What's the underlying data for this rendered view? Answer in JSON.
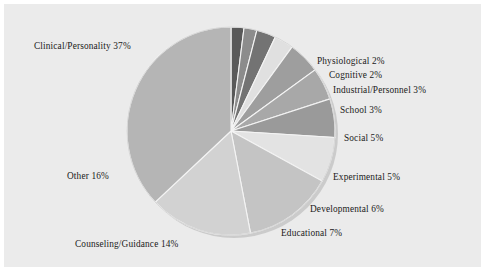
{
  "figure": {
    "background_color": "#ebebeb",
    "page_color": "#ffffff",
    "text_color": "#1a1a1a"
  },
  "chart_data": {
    "type": "pie",
    "title": "",
    "subtitle": "",
    "xlabel": "",
    "ylabel": "",
    "legend_position": "none",
    "grid": false,
    "labels_inline": true,
    "total_percent": 100,
    "units": "percent",
    "center": {
      "x": 231,
      "y": 131
    },
    "radius": 104,
    "start_angle_deg": 0,
    "direction": "clockwise",
    "slices": [
      {
        "label": "Physiological",
        "value": 2,
        "display": "Physiological 2%",
        "color": "#595959"
      },
      {
        "label": "Cognitive",
        "value": 2,
        "display": "Cognitive 2%",
        "color": "#8c8c8c"
      },
      {
        "label": "Industrial/Personnel",
        "value": 3,
        "display": "Industrial/Personnel 3%",
        "color": "#737373"
      },
      {
        "label": "School",
        "value": 3,
        "display": "School 3%",
        "color": "#e0e0e0"
      },
      {
        "label": "Social",
        "value": 5,
        "display": "Social 5%",
        "color": "#9e9e9e"
      },
      {
        "label": "Experimental",
        "value": 5,
        "display": "Experimental 5%",
        "color": "#a8a8a8"
      },
      {
        "label": "Developmental",
        "value": 6,
        "display": "Developmental 6%",
        "color": "#9a9a9a"
      },
      {
        "label": "Educational",
        "value": 7,
        "display": "Educational 7%",
        "color": "#e3e3e3"
      },
      {
        "label": "Counseling/Guidance",
        "value": 14,
        "display": "Counseling/Guidance 14%",
        "color": "#c4c4c4"
      },
      {
        "label": "Other",
        "value": 16,
        "display": "Other 16%",
        "color": "#d2d2d2"
      },
      {
        "label": "Clinical/Personality",
        "value": 37,
        "display": "Clinical/Personality 37%",
        "color": "#b5b5b5"
      }
    ],
    "categories": [
      "Physiological",
      "Cognitive",
      "Industrial/Personnel",
      "School",
      "Social",
      "Experimental",
      "Developmental",
      "Educational",
      "Counseling/Guidance",
      "Other",
      "Clinical/Personality"
    ],
    "values": [
      2,
      2,
      3,
      3,
      5,
      5,
      6,
      7,
      14,
      16,
      37
    ]
  },
  "labels": {
    "clinical": "Clinical/Personality 37%",
    "physiological": "Physiological 2%",
    "cognitive": "Cognitive 2%",
    "industrial": "Industrial/Personnel 3%",
    "school": "School 3%",
    "social": "Social 5%",
    "experimental": "Experimental 5%",
    "developmental": "Developmental 6%",
    "educational": "Educational 7%",
    "counseling": "Counseling/Guidance 14%",
    "other": "Other 16%"
  }
}
